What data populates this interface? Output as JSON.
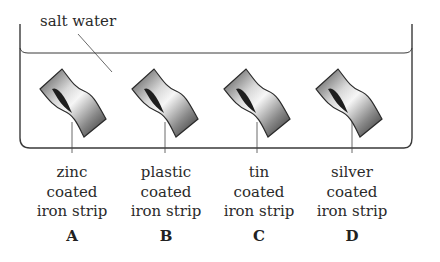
{
  "diagram": {
    "water_label": "salt water",
    "strips": [
      {
        "letter": "A",
        "line1": "zinc",
        "line2": "coated",
        "line3": "iron strip"
      },
      {
        "letter": "B",
        "line1": "plastic",
        "line2": "coated",
        "line3": "iron strip"
      },
      {
        "letter": "C",
        "line1": "tin",
        "line2": "coated",
        "line3": "iron strip"
      },
      {
        "letter": "D",
        "line1": "silver",
        "line2": "coated",
        "line3": "iron strip"
      }
    ],
    "colors": {
      "outline": "#3a3a3a",
      "strip_dark": "#2b2b2b",
      "strip_light": "#f2f2f2"
    }
  }
}
